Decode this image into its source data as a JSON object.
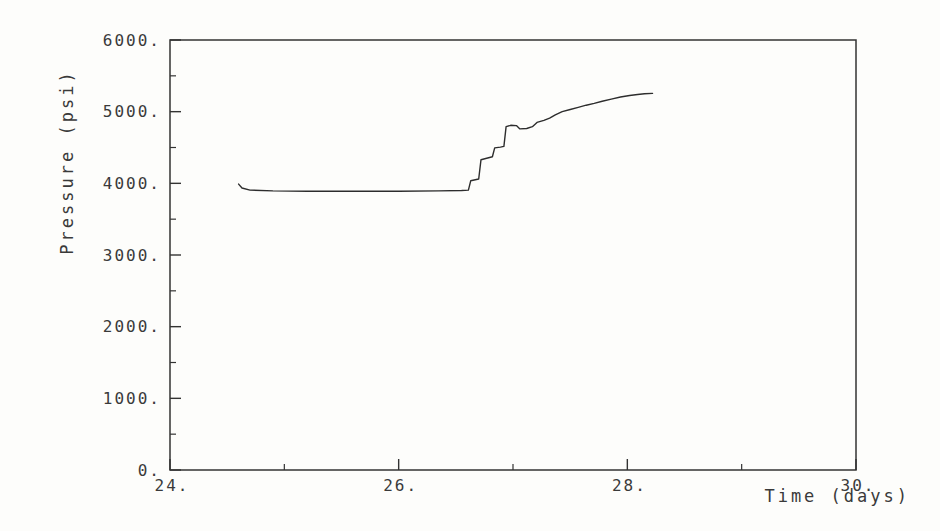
{
  "figure": {
    "background": "#fdfdfb",
    "ink": "#333333",
    "line_color": "#2d2d2d",
    "text_color": "#3a3a3a"
  },
  "chart_data": {
    "type": "line",
    "title": "",
    "xlabel": "Time (days)",
    "ylabel": "Pressure (psi)",
    "xlim": [
      24,
      30
    ],
    "ylim": [
      0,
      6000
    ],
    "grid": false,
    "legend": null,
    "frame": "box",
    "x_major_ticks": [
      24,
      26,
      28,
      30
    ],
    "x_major_tick_labels": [
      "24.",
      "26.",
      "28.",
      "30."
    ],
    "x_minor_ticks": [
      25,
      27,
      29
    ],
    "y_major_ticks": [
      0,
      1000,
      2000,
      3000,
      4000,
      5000,
      6000
    ],
    "y_major_tick_labels": [
      "0.",
      "1000.",
      "2000.",
      "3000.",
      "4000.",
      "5000.",
      "6000."
    ],
    "y_minor_ticks": [
      500,
      1500,
      2500,
      3500,
      4500,
      5500
    ],
    "series": [
      {
        "name": "pressure",
        "points": [
          [
            24.6,
            3990
          ],
          [
            24.63,
            3935
          ],
          [
            24.7,
            3905
          ],
          [
            24.9,
            3895
          ],
          [
            25.2,
            3890
          ],
          [
            25.6,
            3890
          ],
          [
            26.0,
            3890
          ],
          [
            26.35,
            3895
          ],
          [
            26.55,
            3900
          ],
          [
            26.61,
            3905
          ],
          [
            26.63,
            4035
          ],
          [
            26.67,
            4050
          ],
          [
            26.7,
            4060
          ],
          [
            26.72,
            4330
          ],
          [
            26.77,
            4350
          ],
          [
            26.82,
            4370
          ],
          [
            26.84,
            4495
          ],
          [
            26.89,
            4505
          ],
          [
            26.92,
            4515
          ],
          [
            26.94,
            4790
          ],
          [
            26.98,
            4810
          ],
          [
            27.03,
            4805
          ],
          [
            27.06,
            4760
          ],
          [
            27.12,
            4765
          ],
          [
            27.17,
            4790
          ],
          [
            27.21,
            4850
          ],
          [
            27.27,
            4880
          ],
          [
            27.32,
            4910
          ],
          [
            27.37,
            4955
          ],
          [
            27.43,
            5000
          ],
          [
            27.5,
            5030
          ],
          [
            27.57,
            5060
          ],
          [
            27.64,
            5090
          ],
          [
            27.71,
            5115
          ],
          [
            27.78,
            5145
          ],
          [
            27.86,
            5175
          ],
          [
            27.94,
            5205
          ],
          [
            28.02,
            5225
          ],
          [
            28.09,
            5240
          ],
          [
            28.15,
            5250
          ],
          [
            28.22,
            5255
          ]
        ]
      }
    ]
  }
}
